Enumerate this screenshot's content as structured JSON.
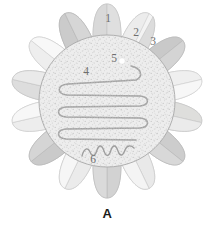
{
  "figure": {
    "panel_label": "A",
    "diagram_type": "radial-cross-section-schematic",
    "background_color": "#ffffff"
  },
  "colors": {
    "disc_fill": "#ededed",
    "disc_stipple": "#b9b9b9",
    "disc_outline": "#a8a8a8",
    "coil_stroke": "#9a9a9a",
    "label_text": "#6e6e6e",
    "caption_text": "#1a1a1a",
    "lobe_light": "#f4f4f4",
    "lobe_mid": "#e3e3e3",
    "lobe_dark": "#cfcfcf",
    "lobe_outline": "#bdbdbd",
    "dot_fill": "#ffffff"
  },
  "callouts": [
    {
      "id": "callout-1",
      "text": "1",
      "x": 108,
      "y": 22,
      "target": "top-outer-lobe"
    },
    {
      "id": "callout-2",
      "text": "2",
      "x": 136,
      "y": 36,
      "target": "lobe-wedge-outer"
    },
    {
      "id": "callout-3",
      "text": "3",
      "x": 153,
      "y": 45,
      "target": "lobe-wedge-inner"
    },
    {
      "id": "callout-4",
      "text": "4",
      "x": 86,
      "y": 75,
      "target": "coiled-tube"
    },
    {
      "id": "callout-5",
      "text": "5",
      "x": 114,
      "y": 62,
      "target": "white-dot"
    },
    {
      "id": "callout-6",
      "text": "6",
      "x": 93,
      "y": 163,
      "target": "wavy-filament"
    }
  ],
  "central_disc": {
    "name": "central-stippled-disc",
    "center_x": 107,
    "center_y": 101,
    "radius_x": 68,
    "radius_y": 66
  },
  "coiled_tube": {
    "name": "serpentine-coiled-tube",
    "turns": 5,
    "orientation": "horizontal-serpentine"
  },
  "white_dot": {
    "name": "white-dot-marker",
    "x": 122,
    "y": 61,
    "radius": 3
  },
  "wavy_filament": {
    "name": "wavy-filament-segment",
    "start_x": 82,
    "end_x": 134,
    "y": 150
  },
  "lobes": {
    "name": "radial-petal-lobes",
    "count": 14,
    "shading_sequence": [
      "mid",
      "light",
      "dark",
      "light",
      "mid",
      "light",
      "dark",
      "mid",
      "light",
      "dark",
      "light",
      "mid",
      "light",
      "dark"
    ]
  }
}
